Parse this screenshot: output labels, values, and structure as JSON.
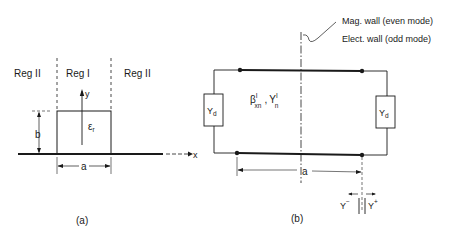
{
  "figure_a": {
    "caption": "(a)",
    "regions": {
      "left": "Reg II",
      "center": "Reg I",
      "right": "Reg II"
    },
    "axes": {
      "x": "x",
      "y": "y"
    },
    "dimensions": {
      "height": "b",
      "width": "a"
    },
    "material": {
      "base": "ε",
      "sub": "r"
    }
  },
  "figure_b": {
    "caption": "(b)",
    "wall_note_line1": "Mag. wall (even mode)",
    "wall_note_line2": "Elect. wall (odd mode)",
    "left_admittance": {
      "base": "Y",
      "sub": "d"
    },
    "right_admittance": {
      "base": "Y",
      "sub": "d"
    },
    "line_params": {
      "beta": "β",
      "beta_sup": "I",
      "beta_sub": "xn",
      "sep": ",",
      "y": "Y",
      "y_sup": "I",
      "y_sub": "n"
    },
    "dimension": "a",
    "y_minus": {
      "base": "Y",
      "sup": "−"
    },
    "y_plus": {
      "base": "Y",
      "sup": "+"
    }
  }
}
